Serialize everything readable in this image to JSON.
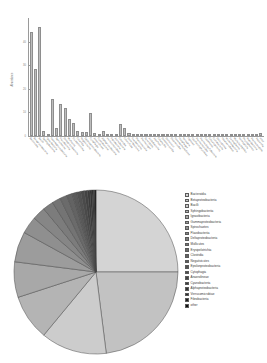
{
  "figure": {
    "title": "",
    "panels": [
      "bar-chart",
      "pie-chart"
    ],
    "palette": "grayscale"
  },
  "chart_data": [
    {
      "type": "bar",
      "title": "",
      "xlabel": "",
      "ylabel": "Abundance",
      "ylim": [
        0,
        50
      ],
      "yticks": [
        "0",
        "10",
        "20",
        "30",
        "40"
      ],
      "grid": false,
      "bar_color": "#bdbdbd",
      "categories": [
        "Bacteroidia",
        "Betaproteobacteria",
        "Bacilli",
        "Sphingobacteriia",
        "Ignavibacteria",
        "Gammaproteobacteria",
        "Spirochaetes",
        "Flavobacteriia",
        "Deltaproteobacteria",
        "Mollicutes",
        "Erysipelotrichia",
        "Clostridia",
        "Negativicutes",
        "Epsilonproteobacteria",
        "Cytophagia",
        "Anaerolineae",
        "Cyanobacteria",
        "Alphaproteobacteria",
        "Verrucomicrobiae",
        "Fibrobacteria",
        "Actinobacteria",
        "Chlorobia",
        "Chloroflexia",
        "Deferribacteres",
        "Fusobacteriia",
        "Planctomycetia",
        "Thermotogae",
        "Synergistia",
        "Acidobacteriia",
        "Aquificae",
        "Chlamydiia",
        "Dehalococcoidia",
        "Deinococci",
        "Elusimicrobia",
        "Gemmatimonadetes",
        "Holophagae",
        "Nitrospira",
        "Opitutae",
        "Oscillatoriophycideae",
        "Thermomicrobia",
        "Thermodesulfobacteria",
        "Caldilineae",
        "Chrysiogenetes",
        "Coriobacteriia",
        "Dictyoglomia",
        "Halanaerobiaea",
        "Ktedonobacteria",
        "Lentisphaeria",
        "Methylacidiphilae",
        "Nitriliruptoria",
        "Phycisphaerae",
        "Rubrobacteria",
        "Thermoleophilia",
        "Tissierellia",
        "other"
      ],
      "values": [
        44.0,
        28.5,
        46.0,
        2.0,
        0.3,
        15.5,
        3.6,
        13.5,
        12.0,
        7.0,
        5.4,
        2.1,
        1.9,
        1.6,
        9.6,
        1.2,
        0.9,
        2.2,
        0.6,
        0.5,
        0.4,
        5.0,
        3.2,
        1.4,
        0.4,
        0.3,
        0.3,
        0.25,
        0.2,
        0.2,
        0.15,
        0.15,
        0.15,
        0.1,
        0.1,
        0.1,
        0.1,
        0.1,
        0.1,
        0.1,
        0.08,
        0.08,
        0.08,
        0.08,
        0.08,
        1.0,
        0.9,
        0.1,
        0.1,
        0.1,
        0.1,
        0.1,
        0.1,
        0.1,
        1.2
      ]
    },
    {
      "type": "pie",
      "title": "",
      "legend_position": "right",
      "labels": [
        "Bacteroidia",
        "Betaproteobacteria",
        "Bacilli",
        "Sphingobacteriia",
        "Ignavibacteria",
        "Gammaproteobacteria",
        "Spirochaetes",
        "Flavobacteriia",
        "Deltaproteobacteria",
        "Mollicutes",
        "Erysipelotrichia",
        "Clostridia",
        "Negativicutes",
        "Epsilonproteobacteria",
        "Cytophagia",
        "Anaerolineae",
        "Cyanobacteria",
        "Alphaproteobacteria",
        "Verrucomicrobiae",
        "Fibrobacteria",
        "other"
      ],
      "values": [
        25.0,
        23.0,
        13.0,
        9.0,
        7.0,
        6.0,
        3.4,
        2.6,
        2.1,
        1.7,
        1.4,
        1.1,
        0.9,
        0.8,
        0.7,
        0.6,
        0.5,
        0.4,
        0.3,
        0.25,
        0.25
      ],
      "colors": [
        "#d4d4d4",
        "#c2c2c2",
        "#cccccc",
        "#b4b4b4",
        "#a8a8a8",
        "#9c9c9c",
        "#8f8f8f",
        "#868686",
        "#7c7c7c",
        "#747474",
        "#6b6b6b",
        "#636363",
        "#5a5a5a",
        "#525252",
        "#4a4a4a",
        "#424242",
        "#3a3a3a",
        "#323232",
        "#2a2a2a",
        "#1f1f1f",
        "#101010"
      ]
    }
  ]
}
